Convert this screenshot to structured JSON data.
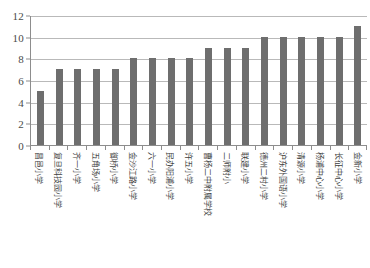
{
  "chart_data": {
    "type": "bar",
    "title": "",
    "subtitle": "",
    "xlabel": "",
    "ylabel": "",
    "ylim": [
      0,
      12
    ],
    "y_ticks": [
      0,
      2,
      4,
      6,
      8,
      10,
      12
    ],
    "grid": true,
    "legend": null,
    "legend_position": "none",
    "bar_color": "#6e6e6e",
    "axis_color": "#8d8d8d",
    "gridline_color": "#b9b9b9",
    "categories": [
      "昌邑小学",
      "复旦科技园小学",
      "齐一小学",
      "五角场小学",
      "御桥小学",
      "金沙江路小学",
      "六一小学",
      "民办阳浦小学",
      "许五小学",
      "曹杨二中附属学校",
      "二师附小",
      "联建小学",
      "德州二村小学",
      "沪东外国语小学",
      "清源小学",
      "杨浦中心小学",
      "长征中心小学",
      "金新小学"
    ],
    "values": [
      5,
      7,
      7,
      7,
      7,
      8,
      8,
      8,
      8,
      9,
      9,
      9,
      10,
      10,
      10,
      10,
      10,
      11
    ]
  }
}
